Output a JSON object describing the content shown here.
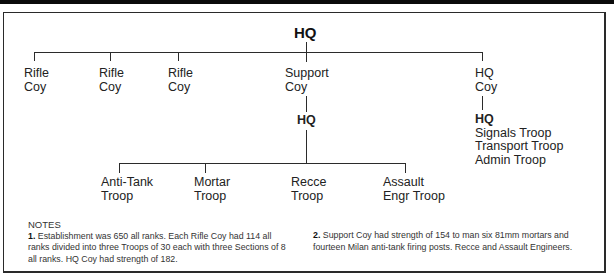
{
  "diagram": {
    "title": "HQ",
    "top_level_units": [
      {
        "line1": "Rifle",
        "line2": "Coy"
      },
      {
        "line1": "Rifle",
        "line2": "Coy"
      },
      {
        "line1": "Rifle",
        "line2": "Coy"
      },
      {
        "line1": "Support",
        "line2": "Coy"
      },
      {
        "line1": "HQ",
        "line2": "Coy"
      }
    ],
    "support_coy": {
      "hq_label": "HQ",
      "troops": [
        {
          "line1": "Anti-Tank",
          "line2": "Troop"
        },
        {
          "line1": "Mortar",
          "line2": "Troop"
        },
        {
          "line1": "Recce",
          "line2": "Troop"
        },
        {
          "line1": "Assault",
          "line2": "Engr Troop"
        }
      ]
    },
    "hq_coy": {
      "hq_label": "HQ",
      "troops": [
        "Signals Troop",
        "Transport Troop",
        "Admin Troop"
      ]
    }
  },
  "notes": {
    "heading": "NOTES",
    "note1_num": "1.",
    "note1_text": " Establishment was 650 all ranks. Each Rifle Coy had 114 all ranks divided into three Troops of 30 each with three Sections of 8 all ranks. HQ Coy had strength of 182.",
    "note2_num": "2.",
    "note2_text": " Support Coy had strength of 154 to man six 81mm mortars and fourteen Milan anti-tank firing posts. Recce and Assault Engineers."
  }
}
